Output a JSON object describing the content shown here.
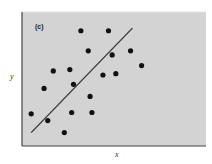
{
  "chart_data": {
    "type": "scatter",
    "title": "",
    "panel_label": "(c)",
    "xlabel": "x",
    "ylabel": "y",
    "xlim": [
      0,
      10
    ],
    "ylim": [
      0,
      10
    ],
    "grid": false,
    "legend": null,
    "axis_ticks": "none",
    "background_color": "#d3d3d3",
    "point_color": "#111111",
    "line_color": "#333333",
    "points": [
      {
        "x": 3.2,
        "y": 8.6
      },
      {
        "x": 4.7,
        "y": 8.6
      },
      {
        "x": 3.6,
        "y": 7.1
      },
      {
        "x": 4.9,
        "y": 6.8
      },
      {
        "x": 5.9,
        "y": 7.1
      },
      {
        "x": 6.5,
        "y": 6.0
      },
      {
        "x": 1.7,
        "y": 5.6
      },
      {
        "x": 2.6,
        "y": 5.7
      },
      {
        "x": 4.4,
        "y": 5.3
      },
      {
        "x": 5.1,
        "y": 5.4
      },
      {
        "x": 2.8,
        "y": 4.6
      },
      {
        "x": 1.2,
        "y": 4.3
      },
      {
        "x": 3.7,
        "y": 3.7
      },
      {
        "x": 0.5,
        "y": 2.4
      },
      {
        "x": 2.7,
        "y": 2.5
      },
      {
        "x": 3.8,
        "y": 2.5
      },
      {
        "x": 1.4,
        "y": 1.9
      },
      {
        "x": 2.3,
        "y": 1.0
      }
    ],
    "fit_line": {
      "x": [
        0.5,
        6.0
      ],
      "y": [
        1.0,
        8.8
      ]
    }
  }
}
